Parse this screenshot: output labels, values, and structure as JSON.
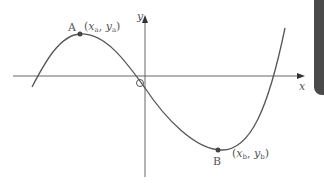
{
  "diagram": {
    "type": "cubic function graph",
    "axes": {
      "x_label": "x",
      "y_label": "y",
      "origin_label": "O"
    },
    "points": [
      {
        "name": "A",
        "label": "A",
        "coords": "(x_a, y_a)",
        "x_sub": "a",
        "y_sub": "a",
        "kind": "local maximum"
      },
      {
        "name": "B",
        "label": "B",
        "coords": "(x_b, y_b)",
        "x_sub": "b",
        "y_sub": "b",
        "kind": "local minimum"
      }
    ],
    "colors": {
      "curve": "#555555",
      "axes": "#666666",
      "point": "#444444",
      "side_tab": "#4a4a4a"
    }
  }
}
